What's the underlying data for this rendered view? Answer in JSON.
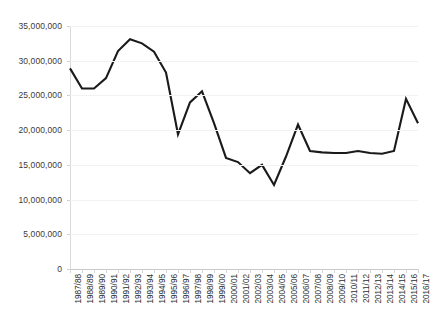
{
  "chart_data": {
    "type": "line",
    "title": "",
    "xlabel": "",
    "ylabel": "",
    "ylim": [
      0,
      35000000
    ],
    "ytick_values": [
      0,
      5000000,
      10000000,
      15000000,
      20000000,
      25000000,
      30000000,
      35000000
    ],
    "ytick_labels": [
      "0",
      "5,000,000",
      "10,000,000",
      "15,000,000",
      "20,000,000",
      "25,000,000",
      "30,000,000",
      "35,000,000"
    ],
    "grid": true,
    "legend": "none",
    "line_color": "#1a1a1a",
    "categories": [
      "1987/88",
      "1988/89",
      "1989/90",
      "1990/91",
      "1991/92",
      "1992/93",
      "1993/94",
      "1994/95",
      "1995/96",
      "1996/97",
      "1997/98",
      "1998/99",
      "1999/00",
      "2000/01",
      "2001/02",
      "2002/03",
      "2003/04",
      "2004/05",
      "2005/06",
      "2006/07",
      "2007/08",
      "2008/09",
      "2009/10",
      "2010/11",
      "2011/12",
      "2012/13",
      "2013/14",
      "2014/15",
      "2015/16",
      "2016/17"
    ],
    "values": [
      28900000,
      26000000,
      26000000,
      27500000,
      31400000,
      33100000,
      32500000,
      31300000,
      28300000,
      19400000,
      24000000,
      25600000,
      21000000,
      16000000,
      15400000,
      13800000,
      15000000,
      12100000,
      16200000,
      20800000,
      17000000,
      16800000,
      16700000,
      16700000,
      17000000,
      16700000,
      16600000,
      17000000,
      24500000,
      21000000
    ]
  }
}
